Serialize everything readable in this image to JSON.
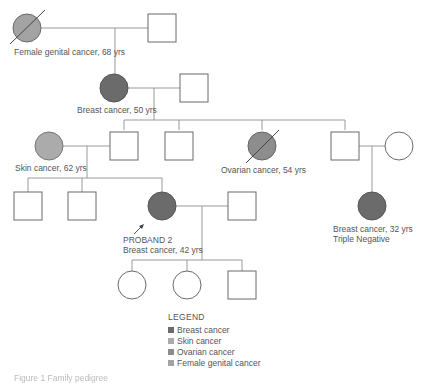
{
  "colors": {
    "breast": "#6b6b6b",
    "skin": "#ababab",
    "ovarian": "#8d8d8d",
    "female_genital": "#a3a3a3",
    "line": "#9a9a9a",
    "outline": "#5a5a5a",
    "text": "#555555"
  },
  "generations": {
    "gen1": {
      "female": {
        "affected": "Female genital cancer",
        "deceased": true
      },
      "label": "Female genital cancer, 68 yrs"
    },
    "gen2": {
      "female": {
        "affected": "Breast cancer"
      },
      "label": "Breast cancer, 50 yrs"
    },
    "gen3": {
      "skin_label": "Skin cancer, 62 yrs",
      "ovarian_label": "Ovarian cancer, 54 yrs",
      "ovarian_deceased": true
    },
    "gen4": {
      "proband_title": "PROBAND 2",
      "proband_label": "Breast cancer, 42 yrs",
      "cousin_label_1": "Breast cancer, 32 yrs",
      "cousin_label_2": "Triple Negative"
    }
  },
  "legend": {
    "title": "LEGEND",
    "items": [
      {
        "label": "Breast cancer",
        "color": "#6b6b6b"
      },
      {
        "label": "Skin cancer",
        "color": "#ababab"
      },
      {
        "label": "Ovarian cancer",
        "color": "#8d8d8d"
      },
      {
        "label": "Female genital cancer",
        "color": "#a3a3a3"
      }
    ]
  },
  "caption": "Figure 1 Family pedigree"
}
